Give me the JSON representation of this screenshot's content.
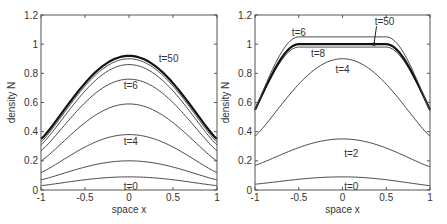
{
  "chart_data": [
    {
      "type": "line",
      "panel": "left",
      "title": "",
      "xlabel": "space x",
      "ylabel": "density N",
      "xlim": [
        -1,
        1
      ],
      "ylim": [
        0,
        1.2
      ],
      "xticks": [
        "-1",
        "-0.5",
        "0",
        "0.5",
        "1"
      ],
      "yticks": [
        "0",
        "0.2",
        "0.4",
        "0.6",
        "0.8",
        "1",
        "1.2"
      ],
      "grid": false,
      "annotations": [
        {
          "text": "t=50",
          "x": 0.45,
          "y": 0.9
        },
        {
          "text": "t=6",
          "x": 0.02,
          "y": 0.71
        },
        {
          "text": "t=4",
          "x": 0.02,
          "y": 0.33
        },
        {
          "text": "t=0",
          "x": 0.02,
          "y": 0.02
        }
      ],
      "series": [
        {
          "name": "t=0",
          "peak": 0.09,
          "edge": 0.03,
          "width": 1
        },
        {
          "name": "curve-2",
          "peak": 0.2,
          "edge": 0.07,
          "width": 1
        },
        {
          "name": "t=4",
          "peak": 0.38,
          "edge": 0.12,
          "width": 1
        },
        {
          "name": "curve-4",
          "peak": 0.59,
          "edge": 0.2,
          "width": 1
        },
        {
          "name": "t=6",
          "peak": 0.76,
          "edge": 0.27,
          "width": 1
        },
        {
          "name": "curve-6",
          "peak": 0.86,
          "edge": 0.31,
          "width": 1
        },
        {
          "name": "curve-7",
          "peak": 0.9,
          "edge": 0.33,
          "width": 1
        },
        {
          "name": "t=50",
          "peak": 0.92,
          "edge": 0.35,
          "width": 2.2
        }
      ]
    },
    {
      "type": "line",
      "panel": "right",
      "title": "",
      "xlabel": "space x",
      "ylabel": "density N",
      "xlim": [
        -1,
        1
      ],
      "ylim": [
        0,
        1.2
      ],
      "xticks": [
        "-1",
        "-0.5",
        "0",
        "0.5",
        "1"
      ],
      "yticks": [
        "0",
        "0.2",
        "0.4",
        "0.6",
        "0.8",
        "1",
        "1.2"
      ],
      "grid": false,
      "annotations": [
        {
          "text": "t=6",
          "x": -0.5,
          "y": 1.08
        },
        {
          "text": "t=50",
          "x": 0.48,
          "y": 1.15,
          "arrow_to": [
            0.36,
            1.0
          ]
        },
        {
          "text": "t=8",
          "x": -0.28,
          "y": 0.93
        },
        {
          "text": "t=4",
          "x": 0.0,
          "y": 0.82
        },
        {
          "text": "t=2",
          "x": 0.1,
          "y": 0.25
        },
        {
          "text": "t=0",
          "x": 0.1,
          "y": 0.02
        }
      ],
      "series": [
        {
          "name": "t=0",
          "shape": "bell",
          "peak": 0.09,
          "edge_left": 0.04,
          "edge_right": 0.03,
          "width": 1
        },
        {
          "name": "t=2",
          "shape": "bell",
          "peak": 0.35,
          "edge_left": 0.17,
          "edge_right": 0.16,
          "width": 1
        },
        {
          "name": "t=4",
          "shape": "bell",
          "peak": 0.9,
          "edge_left": 0.37,
          "edge_right": 0.37,
          "width": 1
        },
        {
          "name": "t=8",
          "shape": "plateau",
          "plateau": 0.98,
          "edge_left": 0.55,
          "edge_right": 0.55,
          "width": 1
        },
        {
          "name": "t=50",
          "shape": "plateau",
          "plateau": 1.0,
          "edge_left": 0.55,
          "edge_right": 0.55,
          "width": 2.2
        },
        {
          "name": "t=6",
          "shape": "plateau",
          "plateau": 1.05,
          "edge_left": 0.55,
          "edge_right": 0.54,
          "width": 1
        }
      ]
    }
  ]
}
